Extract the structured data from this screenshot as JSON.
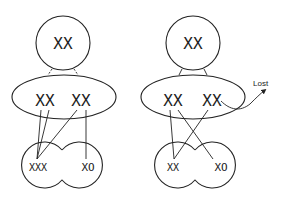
{
  "diagram": {
    "left_panel": {
      "top_cell": {
        "chromosomes": "XX"
      },
      "middle_cell": {
        "chromosome_pair_1": "XX",
        "chromosome_pair_2": "XX"
      },
      "daughter_cell_left": {
        "chromosomes": "XXX"
      },
      "daughter_cell_right": {
        "chromosomes": "XO"
      }
    },
    "right_panel": {
      "top_cell": {
        "chromosomes": "XX"
      },
      "middle_cell": {
        "chromosome_pair_1": "XX",
        "chromosome_pair_2": "XX"
      },
      "lost_label": "Lost",
      "daughter_cell_left": {
        "chromosomes": "XX"
      },
      "daughter_cell_right": {
        "chromosomes": "XO"
      }
    }
  }
}
